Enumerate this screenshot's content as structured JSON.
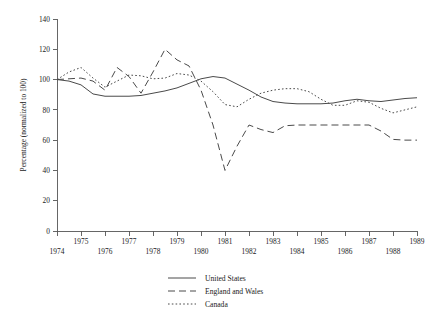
{
  "chart_data": {
    "type": "line",
    "title": "",
    "subtitle": "",
    "xlabel": "",
    "ylabel": "Percentage (normalized to 100)",
    "xlim": [
      1974,
      1989
    ],
    "ylim": [
      0,
      140
    ],
    "grid": false,
    "legend_position": "bottom-center",
    "x_tick_labels": [
      "1974",
      "1975",
      "1976",
      "1977",
      "1978",
      "1979",
      "1980",
      "1981",
      "1982",
      "1983",
      "1984",
      "1985",
      "1986",
      "1987",
      "1988",
      "1989"
    ],
    "x_tick_values": [
      1974,
      1975,
      1976,
      1977,
      1978,
      1979,
      1980,
      1981,
      1982,
      1983,
      1984,
      1985,
      1986,
      1987,
      1988,
      1989
    ],
    "y_tick_labels": [
      "0",
      "20",
      "40",
      "60",
      "80",
      "100",
      "120",
      "140"
    ],
    "y_tick_values": [
      0,
      20,
      40,
      60,
      80,
      100,
      120,
      140
    ],
    "series": [
      {
        "name": "United States",
        "style": "solid",
        "color": "#4a4a4a",
        "x": [
          1974.0,
          1974.5,
          1975.0,
          1975.5,
          1976.0,
          1976.5,
          1977.0,
          1977.5,
          1978.0,
          1978.5,
          1979.0,
          1979.5,
          1980.0,
          1980.5,
          1981.0,
          1981.5,
          1982.0,
          1982.5,
          1983.0,
          1983.5,
          1984.0,
          1984.5,
          1985.0,
          1985.5,
          1986.0,
          1986.5,
          1987.0,
          1987.5,
          1988.0,
          1988.5,
          1989.0
        ],
        "y": [
          100.0,
          99.0,
          96.5,
          90.5,
          89.0,
          89.0,
          89.0,
          89.5,
          91.0,
          92.5,
          94.5,
          97.5,
          100.5,
          102.0,
          101.0,
          97.0,
          93.0,
          88.5,
          85.5,
          84.5,
          84.0,
          84.0,
          84.0,
          84.5,
          86.0,
          87.0,
          86.0,
          85.5,
          86.5,
          87.5,
          88.0
        ]
      },
      {
        "name": "England and Wales",
        "style": "dashed",
        "color": "#4a4a4a",
        "x": [
          1974.0,
          1974.5,
          1975.0,
          1975.5,
          1976.0,
          1976.5,
          1977.0,
          1977.5,
          1978.0,
          1978.5,
          1979.0,
          1979.5,
          1980.0,
          1980.5,
          1981.0,
          1981.5,
          1982.0,
          1982.5,
          1983.0,
          1983.5,
          1984.0,
          1984.5,
          1985.0,
          1985.5,
          1986.0,
          1986.5,
          1987.0,
          1987.5,
          1988.0,
          1988.5,
          1989.0
        ],
        "y": [
          100.0,
          100.5,
          101.0,
          99.0,
          93.0,
          108.0,
          102.0,
          91.0,
          105.0,
          120.0,
          113.0,
          109.0,
          93.0,
          70.0,
          40.0,
          56.0,
          70.0,
          67.0,
          65.0,
          69.5,
          70.0,
          70.0,
          70.0,
          70.0,
          70.0,
          70.0,
          70.0,
          66.0,
          60.5,
          60.0,
          60.0
        ]
      },
      {
        "name": "Canada",
        "style": "dotted",
        "color": "#4a4a4a",
        "x": [
          1974.0,
          1974.5,
          1975.0,
          1975.5,
          1976.0,
          1976.5,
          1977.0,
          1977.5,
          1978.0,
          1978.5,
          1979.0,
          1979.5,
          1980.0,
          1980.5,
          1981.0,
          1981.5,
          1982.0,
          1982.5,
          1983.0,
          1983.5,
          1984.0,
          1984.5,
          1985.0,
          1985.5,
          1986.0,
          1986.5,
          1987.0,
          1987.5,
          1988.0,
          1988.5,
          1989.0
        ],
        "y": [
          100.0,
          105.0,
          108.0,
          101.0,
          95.0,
          99.0,
          103.0,
          102.5,
          100.5,
          101.0,
          104.0,
          103.0,
          99.0,
          92.0,
          83.5,
          82.0,
          87.0,
          91.0,
          93.0,
          94.0,
          94.0,
          92.0,
          87.0,
          83.0,
          83.0,
          86.0,
          85.0,
          81.0,
          78.0,
          80.0,
          82.0
        ]
      }
    ]
  },
  "legend": {
    "items": [
      {
        "label": "United States",
        "style": "solid"
      },
      {
        "label": "England and Wales",
        "style": "dashed"
      },
      {
        "label": "Canada",
        "style": "dotted"
      }
    ]
  }
}
